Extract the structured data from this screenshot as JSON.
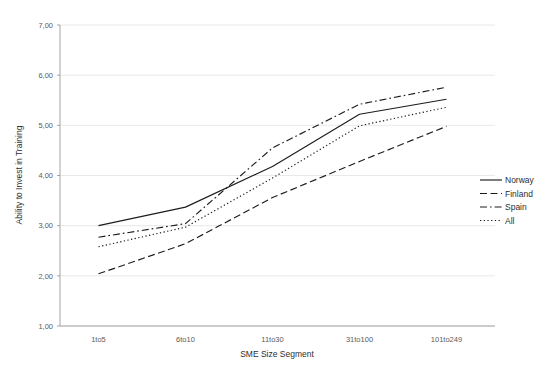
{
  "figure": {
    "faint_header": "",
    "background_color": "#ffffff",
    "line_color": "#1c1c1c",
    "grid_color": "#e3e3e3"
  },
  "chart_data": {
    "type": "line",
    "title": "",
    "xlabel": "SME Size Segment",
    "ylabel": "Ability to Invest in Training",
    "categories": [
      "1to5",
      "6to10",
      "11to30",
      "31to100",
      "101to249"
    ],
    "ylim": [
      1.0,
      7.0
    ],
    "ytick_labels": [
      "7,00",
      "6,00",
      "5,00",
      "4,00",
      "3,00",
      "2,00",
      "1,00"
    ],
    "ytick_values": [
      7.0,
      6.0,
      5.0,
      4.0,
      3.0,
      2.0,
      1.0
    ],
    "grid": true,
    "legend_position": "right",
    "series": [
      {
        "name": "Norway",
        "dash": "solid",
        "values": [
          3.0,
          3.37,
          4.18,
          5.22,
          5.52
        ]
      },
      {
        "name": "Finland",
        "dash": "dashed",
        "values": [
          2.04,
          2.64,
          3.56,
          4.28,
          4.98
        ]
      },
      {
        "name": "Spain",
        "dash": "dashdot",
        "values": [
          2.77,
          3.04,
          4.55,
          5.42,
          5.76
        ]
      },
      {
        "name": "All",
        "dash": "dotted",
        "values": [
          2.58,
          2.97,
          3.95,
          4.99,
          5.36
        ]
      }
    ]
  },
  "legend": {
    "entries": [
      {
        "label": "Norway",
        "dash": "solid"
      },
      {
        "label": "Finland",
        "dash": "dashed"
      },
      {
        "label": "Spain",
        "dash": "dashdot"
      },
      {
        "label": "All",
        "dash": "dotted"
      }
    ]
  }
}
